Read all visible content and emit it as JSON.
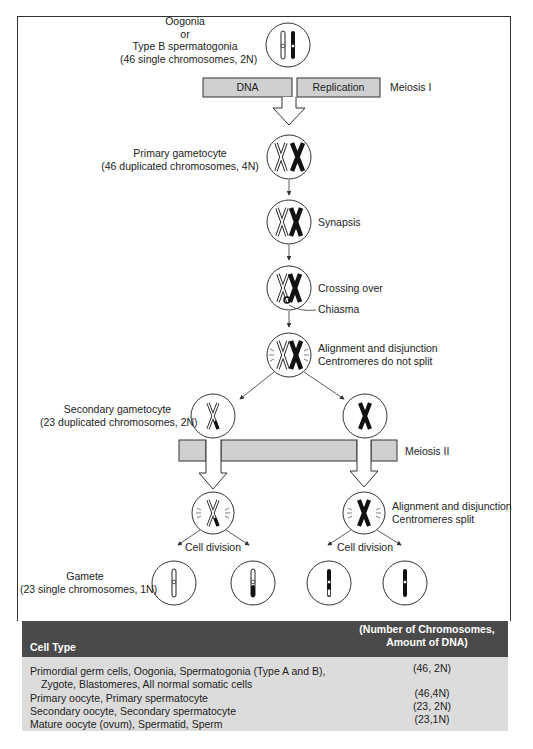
{
  "diagram": {
    "title_block": {
      "line1": "Oogonia",
      "line2": "or",
      "line3": "Type B spermatogonia",
      "line4": "(46 single chromosomes, 2N)"
    },
    "meiosis1_bar": {
      "left_label": "DNA",
      "right_label": "Replication",
      "side_label": "Meiosis I"
    },
    "primary": {
      "line1": "Primary gametocyte",
      "line2": "(46 duplicated chromosomes, 4N)"
    },
    "steps": {
      "synapsis": "Synapsis",
      "crossing_over": "Crossing over",
      "chiasma": "Chiasma",
      "alignment1_line1": "Alignment and disjunction",
      "alignment1_line2": "Centromeres do not split"
    },
    "secondary": {
      "line1": "Secondary gametocyte",
      "line2": "(23 duplicated chromosomes, 2N)"
    },
    "meiosis2_bar": {
      "side_label": "Meiosis II"
    },
    "alignment2": {
      "line1": "Alignment and disjunction",
      "line2": "Centromeres split"
    },
    "cell_division_left": "Cell division",
    "cell_division_right": "Cell division",
    "gamete": {
      "line1": "Gamete",
      "line2": "(23 single chromosomes, 1N)"
    },
    "colors": {
      "bar_fill": "#d0d0d0",
      "outline": "#333333",
      "table_header": "#4a4a4a",
      "table_body": "#dcdcdc"
    }
  },
  "table": {
    "headers": {
      "cell_type": "Cell Type",
      "chrom_line1": "(Number of Chromosomes,",
      "chrom_line2": "Amount of DNA)"
    },
    "rows": [
      {
        "cell_type": "Primordial germ cells, Oogonia, Spermatogonia (Type A and B),",
        "value": "(46, 2N)"
      },
      {
        "cell_type": "Zygote, Blastomeres, All normal somatic cells",
        "value": ""
      },
      {
        "cell_type": "Primary oocyte, Primary spermatocyte",
        "value": "(46,4N)"
      },
      {
        "cell_type": "Secondary oocyte, Secondary spermatocyte",
        "value": "(23, 2N)"
      },
      {
        "cell_type": "Mature oocyte (ovum), Spermatid, Sperm",
        "value": "(23,1N)"
      }
    ]
  }
}
